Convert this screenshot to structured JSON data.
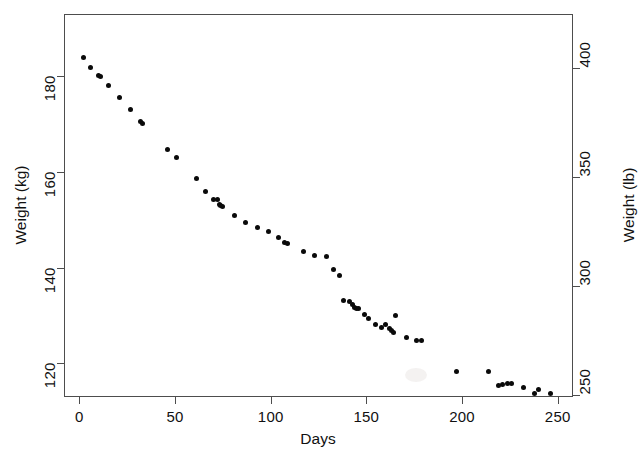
{
  "chart_data": {
    "type": "scatter",
    "title": "",
    "xlabel": "Days",
    "ylabel": "Weight (kg)",
    "y2label": "Weight (lb)",
    "xlim": [
      -8,
      258
    ],
    "ylim": [
      113,
      193
    ],
    "y2lim": [
      249,
      425
    ],
    "grid": false,
    "legend": null,
    "xticks": [
      0,
      50,
      100,
      150,
      200,
      250
    ],
    "xticklabels": [
      "0",
      "50",
      "100",
      "150",
      "200",
      "250"
    ],
    "yticks": [
      120,
      140,
      160,
      180
    ],
    "yticklabels": [
      "120",
      "140",
      "160",
      "180"
    ],
    "y2ticks": [
      250,
      300,
      350,
      400
    ],
    "y2ticklabels": [
      "250",
      "300",
      "350",
      "400"
    ],
    "marker": "filled-circle",
    "marker_color": "#0a0a0a",
    "series": [
      {
        "name": "weight",
        "x": [
          2,
          6,
          10,
          11,
          15,
          21,
          27,
          32,
          33,
          46,
          51,
          61,
          66,
          70,
          72,
          73,
          74,
          75,
          81,
          87,
          93,
          99,
          104,
          107,
          109,
          117,
          123,
          129,
          133,
          136,
          138,
          141,
          143,
          144,
          145,
          146,
          149,
          151,
          155,
          158,
          160,
          162,
          163,
          164,
          165,
          171,
          176,
          179,
          197,
          214,
          219,
          221,
          224,
          226,
          232,
          238,
          240,
          246
        ],
        "y": [
          183.9,
          181.8,
          180.2,
          179.9,
          178.0,
          175.6,
          173.0,
          170.6,
          170.2,
          164.8,
          163.1,
          158.7,
          156.0,
          154.3,
          154.2,
          153.3,
          153.0,
          152.8,
          151.0,
          149.5,
          148.4,
          147.5,
          146.3,
          145.2,
          145.0,
          143.4,
          142.5,
          142.4,
          139.6,
          138.3,
          133.2,
          133.0,
          132.3,
          131.6,
          131.5,
          131.4,
          130.2,
          129.3,
          128.2,
          127.6,
          128.2,
          127.4,
          126.9,
          126.5,
          130.0,
          125.5,
          124.8,
          124.8,
          118.4,
          118.3,
          115.4,
          115.6,
          115.9,
          115.8,
          115.0,
          113.8,
          114.5,
          113.7
        ]
      }
    ]
  },
  "axes": {
    "x": {
      "label": "Days"
    },
    "y_left": {
      "label": "Weight (kg)"
    },
    "y_right": {
      "label": "Weight (lb)"
    }
  }
}
